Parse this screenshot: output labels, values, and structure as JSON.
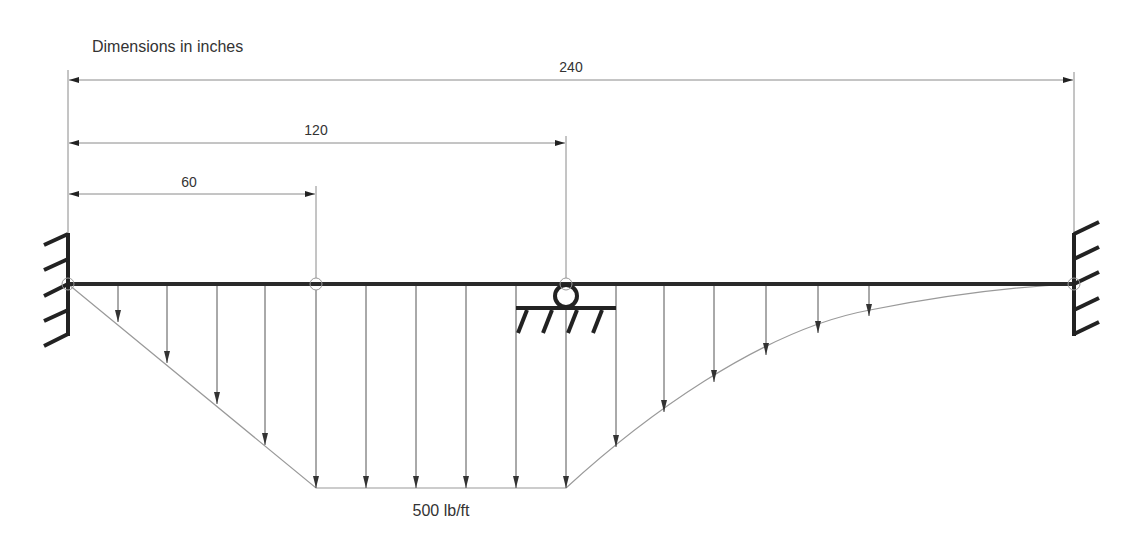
{
  "title": "Dimensions in inches",
  "dimensions": [
    {
      "label": "240",
      "from_x": 68,
      "to_x": 1074,
      "y": 80,
      "text_x": 571,
      "text_y": 72
    },
    {
      "label": "120",
      "from_x": 68,
      "to_x": 566,
      "y": 143,
      "text_x": 316,
      "text_y": 135
    },
    {
      "label": "60",
      "from_x": 68,
      "to_x": 316,
      "y": 194,
      "text_x": 189,
      "text_y": 187
    }
  ],
  "load_label": "500 lb/ft",
  "beam": {
    "x1": 68,
    "x2": 1074,
    "y": 284,
    "length_in": 240
  },
  "supports": {
    "left": "fixed-wall",
    "middle": "roller at 120 in",
    "right": "fixed-wall"
  },
  "hinges": [
    {
      "x": 68,
      "position_in": 0
    },
    {
      "x": 316,
      "position_in": 60
    },
    {
      "x": 566,
      "position_in": 120
    },
    {
      "x": 1074,
      "position_in": 240
    }
  ],
  "load": {
    "max_intensity": "500 lb/ft",
    "segments": [
      "linear ramp 0 to 500 lb/ft from 0 to 60 in",
      "uniform 500 lb/ft from 60 to 120 in",
      "curved decrease 500 to 0 lb/ft from 120 to 240 in"
    ],
    "arrows": [
      {
        "x": 118,
        "y_end": 322
      },
      {
        "x": 167,
        "y_end": 363
      },
      {
        "x": 217,
        "y_end": 404
      },
      {
        "x": 265,
        "y_end": 445
      },
      {
        "x": 316,
        "y_end": 488
      },
      {
        "x": 366,
        "y_end": 488
      },
      {
        "x": 416,
        "y_end": 488
      },
      {
        "x": 466,
        "y_end": 488
      },
      {
        "x": 516,
        "y_end": 488
      },
      {
        "x": 566,
        "y_end": 488
      },
      {
        "x": 616,
        "y_end": 447
      },
      {
        "x": 664,
        "y_end": 412
      },
      {
        "x": 714,
        "y_end": 382
      },
      {
        "x": 766,
        "y_end": 355
      },
      {
        "x": 818,
        "y_end": 333
      },
      {
        "x": 869,
        "y_end": 316
      }
    ]
  },
  "colors": {
    "beam": "#2a2a2a",
    "thin_line": "#8a8a8a",
    "arrow": "#3a3a3a",
    "text": "#333333"
  }
}
